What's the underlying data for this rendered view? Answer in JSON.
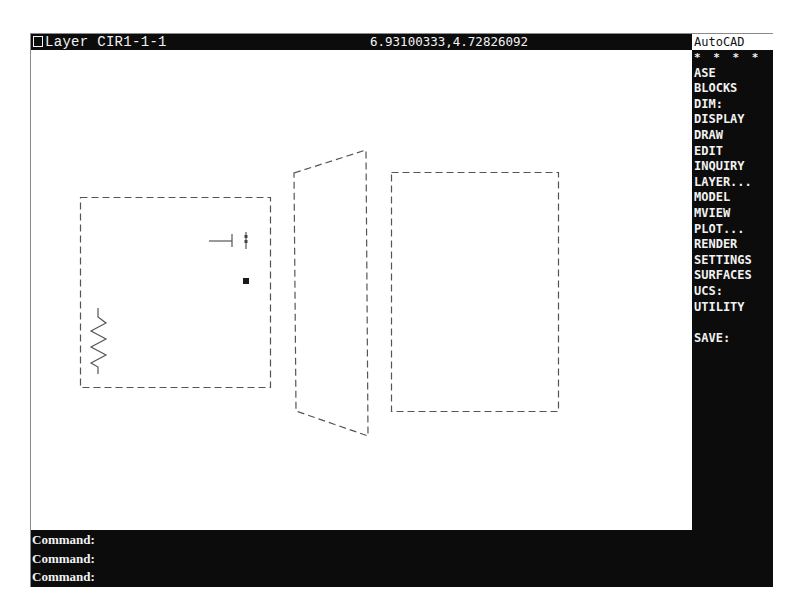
{
  "status_bar": {
    "layer_label": "Layer CIR1-1-1",
    "coordinates": "6.93100333,4.72826092"
  },
  "side_menu": {
    "header": "AutoCAD",
    "items": [
      {
        "label": "* * * *"
      },
      {
        "label": "ASE"
      },
      {
        "label": "BLOCKS"
      },
      {
        "label": "DIM:"
      },
      {
        "label": "DISPLAY"
      },
      {
        "label": "DRAW"
      },
      {
        "label": "EDIT"
      },
      {
        "label": "INQUIRY"
      },
      {
        "label": "LAYER..."
      },
      {
        "label": "MODEL"
      },
      {
        "label": "MVIEW"
      },
      {
        "label": "PLOT..."
      },
      {
        "label": "RENDER"
      },
      {
        "label": "SETTINGS"
      },
      {
        "label": "SURFACES"
      },
      {
        "label": "UCS:"
      },
      {
        "label": "UTILITY"
      },
      {
        "label": ""
      },
      {
        "label": "SAVE:"
      }
    ]
  },
  "command_area": {
    "lines": [
      {
        "prompt": "Command:"
      },
      {
        "prompt": "Command:"
      },
      {
        "prompt": "Command:"
      }
    ]
  },
  "drawing": {
    "line_color": "#555555",
    "entities": [
      {
        "type": "dashed-rectangle",
        "name": "left-viewport-box"
      },
      {
        "type": "resistor-symbol",
        "name": "zigzag-resistor"
      },
      {
        "type": "t-line-symbol",
        "name": "t-junction-line"
      },
      {
        "type": "small-marker",
        "name": "vertical-marker"
      },
      {
        "type": "filled-square",
        "name": "grip-square"
      },
      {
        "type": "dashed-trapezoid",
        "name": "perspective-plane"
      },
      {
        "type": "dashed-rectangle",
        "name": "right-viewport-box"
      }
    ]
  }
}
